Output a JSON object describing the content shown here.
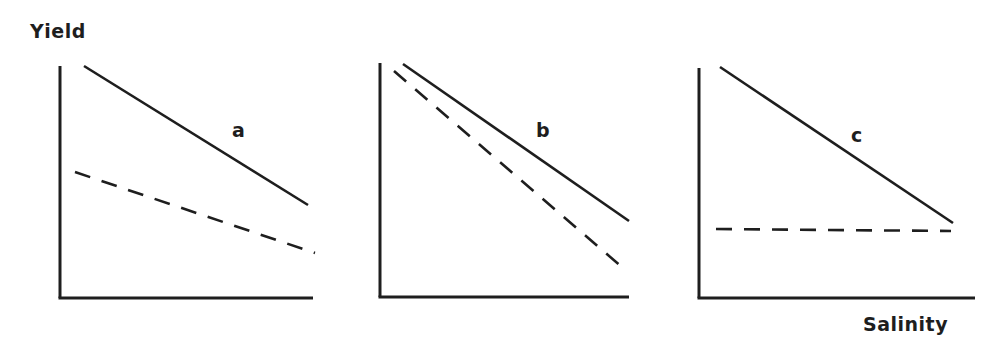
{
  "figure": {
    "ylabel": "Yield",
    "xlabel": "Salinity",
    "line_color": "#1e1e1e",
    "background": "#ffffff"
  },
  "chart_data": [
    {
      "type": "line",
      "panel": "a",
      "title": "",
      "xlabel": "Salinity",
      "ylabel": "Yield",
      "grid": false,
      "legend": null,
      "x": [
        0.1,
        1.0
      ],
      "series": [
        {
          "name": "solid",
          "style": "solid",
          "values": [
            1.0,
            0.4
          ]
        },
        {
          "name": "dashed",
          "style": "dashed",
          "values": [
            0.54,
            0.19
          ]
        }
      ],
      "annotations": [
        {
          "text": "a",
          "x": 0.7,
          "y": 0.7
        }
      ]
    },
    {
      "type": "line",
      "panel": "b",
      "title": "",
      "xlabel": "Salinity",
      "ylabel": "Yield",
      "grid": false,
      "legend": null,
      "x": [
        0.06,
        1.0
      ],
      "series": [
        {
          "name": "solid",
          "style": "solid",
          "values": [
            1.0,
            0.33
          ]
        },
        {
          "name": "dashed",
          "style": "dashed",
          "values": [
            0.97,
            0.13
          ]
        }
      ],
      "annotations": [
        {
          "text": "b",
          "x": 0.65,
          "y": 0.7
        }
      ]
    },
    {
      "type": "line",
      "panel": "c",
      "title": "",
      "xlabel": "Salinity",
      "ylabel": "Yield",
      "grid": false,
      "legend": null,
      "x": [
        0.07,
        1.0
      ],
      "series": [
        {
          "name": "solid",
          "style": "solid",
          "values": [
            1.0,
            0.33
          ]
        },
        {
          "name": "dashed",
          "style": "dashed",
          "values": [
            0.3,
            0.3
          ]
        }
      ],
      "annotations": [
        {
          "text": "c",
          "x": 0.65,
          "y": 0.7
        }
      ]
    }
  ],
  "panels": [
    {
      "label": "a",
      "origin": [
        60,
        298
      ],
      "width": 253,
      "height": 232,
      "solid": [
        84,
        66,
        308,
        205
      ],
      "dashed": [
        75,
        172,
        315,
        253
      ],
      "label_pos": [
        232,
        139
      ]
    },
    {
      "label": "b",
      "origin": [
        380,
        297
      ],
      "width": 249,
      "height": 234,
      "solid": [
        403,
        64,
        629,
        221
      ],
      "dashed": [
        394,
        71,
        623,
        268
      ],
      "label_pos": [
        536,
        139
      ]
    },
    {
      "label": "c",
      "origin": [
        699,
        298
      ],
      "width": 276,
      "height": 230,
      "solid": [
        720,
        67,
        953,
        223
      ],
      "dashed": [
        716,
        229,
        951,
        231
      ],
      "label_pos": [
        851,
        144
      ]
    }
  ]
}
